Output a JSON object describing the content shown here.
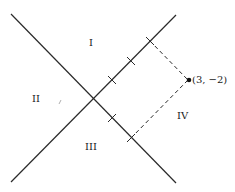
{
  "diagram": {
    "type": "quadrant-axes",
    "colors": {
      "line": "#2a2a2a",
      "dashed": "#2a2a2a",
      "point": "#111111",
      "text": "#222222",
      "background": "#ffffff"
    },
    "regions": [
      {
        "id": "I",
        "label": "I"
      },
      {
        "id": "II",
        "label": "II"
      },
      {
        "id": "III",
        "label": "III"
      },
      {
        "id": "IV",
        "label": "IV"
      }
    ],
    "point": {
      "label": "(3, −2)",
      "coords": [
        3,
        -2
      ]
    },
    "ticks": {
      "upper_right_axis": 3,
      "lower_right_axis": 2
    }
  }
}
